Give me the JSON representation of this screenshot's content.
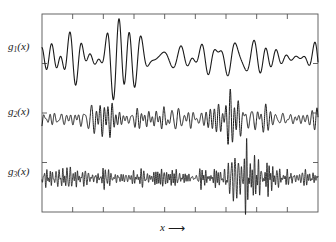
{
  "figure": {
    "title": "",
    "background_color": "#ffffff",
    "trace_color": "#1a1a1a",
    "frame_color": "#555555",
    "width": 336,
    "height": 242
  },
  "labels": {
    "g1": "g",
    "g1_sub": "1",
    "g1_arg": "(x)",
    "g2": "g",
    "g2_sub": "2",
    "g2_arg": "(x)",
    "g3": "g",
    "g3_sub": "3",
    "g3_arg": "(x)",
    "xaxis_symbol": "x",
    "xaxis_arrow": "⟶"
  },
  "chart_data": {
    "type": "line",
    "title": "",
    "xlabel": "x",
    "ylabel": "",
    "grid": false,
    "legend": "none",
    "axis": {
      "frame": true,
      "frame_left_px": 42,
      "frame_top_px": 14,
      "frame_right_px": 318,
      "frame_bottom_px": 212,
      "top_ticks": 8,
      "bottom_ticks": 8,
      "left_ticks": 3,
      "right_ticks": 3,
      "tick_length_px": 5,
      "tick_direction": "inward",
      "xlim": [
        0,
        1
      ],
      "ylim": [
        0,
        1
      ],
      "tick_labels": []
    },
    "series": [
      {
        "name": "g1(x)",
        "label": "g₁(x)",
        "baseline_y_px": 58,
        "amplitude_px": 16,
        "character": "low-frequency modulated oscillation with large transient burst near x=0.27",
        "base_frequency_cycles": 22,
        "burst": {
          "center": 0.27,
          "width": 0.09,
          "gain": 2.6
        }
      },
      {
        "name": "g2(x)",
        "label": "g₂(x)",
        "baseline_y_px": 119,
        "amplitude_px": 12,
        "character": "mid-frequency oscillation with amplified burst near x=0.69",
        "base_frequency_cycles": 52,
        "burst": {
          "center": 0.69,
          "width": 0.055,
          "gain": 2.5
        }
      },
      {
        "name": "g3(x)",
        "label": "g₃(x)",
        "baseline_y_px": 178,
        "amplitude_px": 11,
        "character": "high-frequency oscillation with strong wide burst near x=0.73",
        "base_frequency_cycles": 110,
        "burst": {
          "center": 0.73,
          "width": 0.1,
          "gain": 3.6
        }
      }
    ]
  }
}
